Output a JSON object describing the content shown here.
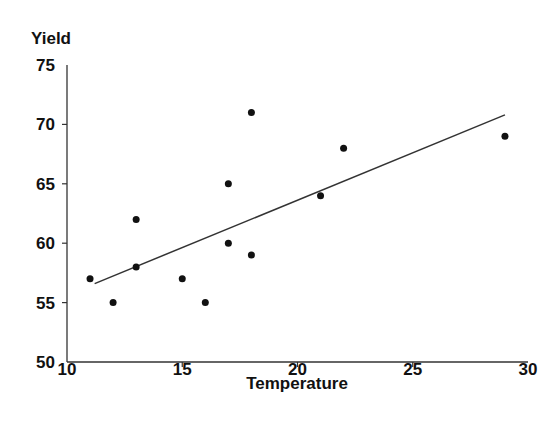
{
  "chart_data": {
    "type": "scatter",
    "title": "",
    "xlabel": "Temperature",
    "ylabel": "Yield",
    "xlim": [
      10,
      30
    ],
    "ylim": [
      50,
      75
    ],
    "xticks": [
      10,
      15,
      20,
      25,
      30
    ],
    "yticks": [
      50,
      55,
      60,
      65,
      70,
      75
    ],
    "grid": false,
    "legend": null,
    "series": [
      {
        "name": "Observations",
        "type": "scatter",
        "points": [
          {
            "x": 11,
            "y": 57
          },
          {
            "x": 12,
            "y": 55
          },
          {
            "x": 13,
            "y": 62
          },
          {
            "x": 13,
            "y": 58
          },
          {
            "x": 15,
            "y": 57
          },
          {
            "x": 16,
            "y": 55
          },
          {
            "x": 17,
            "y": 65
          },
          {
            "x": 17,
            "y": 60
          },
          {
            "x": 18,
            "y": 71
          },
          {
            "x": 18,
            "y": 59
          },
          {
            "x": 21,
            "y": 64
          },
          {
            "x": 22,
            "y": 68
          },
          {
            "x": 29,
            "y": 69
          }
        ],
        "color": "#111111"
      },
      {
        "name": "Fitted line",
        "type": "line",
        "points": [
          {
            "x": 11.2,
            "y": 56.6
          },
          {
            "x": 29,
            "y": 70.8
          }
        ],
        "color": "#333333"
      }
    ]
  }
}
